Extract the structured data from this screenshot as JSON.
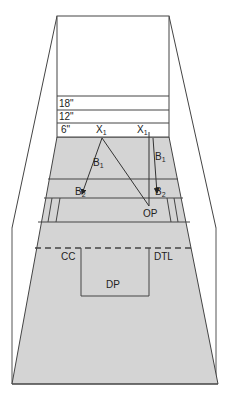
{
  "diagram": {
    "type": "court-perspective",
    "colors": {
      "floor": "#d4d4d4",
      "line": "#333333",
      "background": "#ffffff"
    },
    "wall_markings": [
      "18\"",
      "12\"",
      "6\""
    ],
    "positions": {
      "x1_left": {
        "base": "X",
        "sub": "1"
      },
      "x1_right": {
        "base": "X",
        "sub": "1"
      },
      "b1_left": {
        "base": "B",
        "sub": "1"
      },
      "b1_right": {
        "base": "B",
        "sub": "1"
      },
      "b2_left": {
        "base": "B",
        "sub": "2"
      },
      "b2_right": {
        "base": "B",
        "sub": "2"
      },
      "op": "OP",
      "cc": "CC",
      "dtl": "DTL",
      "dp": "DP"
    }
  }
}
